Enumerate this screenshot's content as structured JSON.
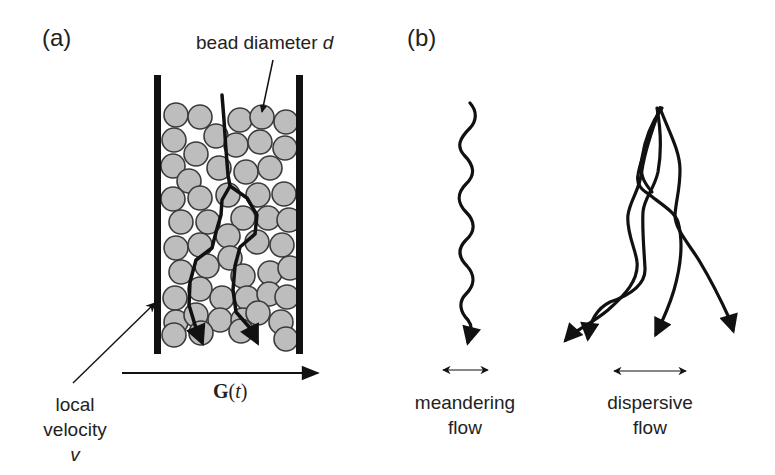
{
  "panel_a": {
    "label": "(a)",
    "bead_label": "bead diameter ",
    "bead_symbol": "d",
    "velocity_label_line1": "local",
    "velocity_label_line2": "velocity",
    "velocity_symbol": "v",
    "gradient_symbol": "G",
    "gradient_open": "(",
    "gradient_var": "t",
    "gradient_close": ")"
  },
  "panel_b": {
    "label": "(b)",
    "meandering_line1": "meandering",
    "meandering_line2": "flow",
    "dispersive_line1": "dispersive",
    "dispersive_line2": "flow"
  },
  "colors": {
    "ink": "#111111",
    "bead_fill": "#bdbdbd",
    "bead_stroke": "#3a3a3a",
    "background": "#ffffff"
  }
}
